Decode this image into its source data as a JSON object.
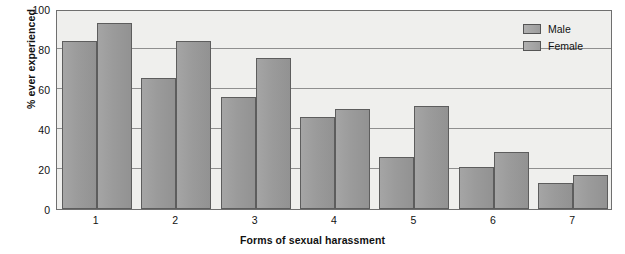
{
  "chart_data": {
    "type": "bar",
    "title": "",
    "xlabel": "Forms of sexual harassment",
    "ylabel": "% ever experienced",
    "categories": [
      "1",
      "2",
      "3",
      "4",
      "5",
      "6",
      "7"
    ],
    "series": [
      {
        "name": "Male",
        "values": [
          84,
          65.5,
          56,
          46,
          26,
          21,
          13
        ]
      },
      {
        "name": "Female",
        "values": [
          93,
          84,
          75.5,
          50,
          51.5,
          28.5,
          17
        ]
      }
    ],
    "ylim": [
      0,
      100
    ],
    "yticks": [
      0,
      20,
      40,
      60,
      80,
      100
    ],
    "ytick_labels": [
      "0",
      "20",
      "40",
      "60",
      "80",
      "100"
    ],
    "grid": true,
    "grid_axis": "y",
    "legend_position": "top-right",
    "colors": {
      "bar_fill": "#9b9b9b",
      "bar_border": "#5d5d5d",
      "plot_background": "#efefed",
      "gridline": "#8f8f8f",
      "frame": "#6f6f6f",
      "text": "#111111"
    }
  },
  "legend": {
    "entries": [
      {
        "label": "Male"
      },
      {
        "label": "Female"
      }
    ]
  }
}
